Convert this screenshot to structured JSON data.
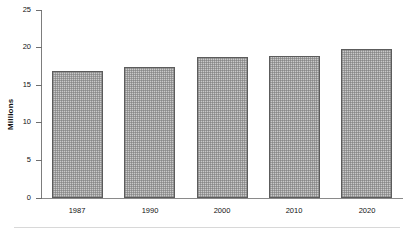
{
  "chart_data": {
    "type": "bar",
    "title": "",
    "subtitle": "",
    "xlabel": "",
    "ylabel": "Millions",
    "categories": [
      "1987",
      "1990",
      "2000",
      "2010",
      "2020"
    ],
    "values": [
      16.9,
      17.4,
      18.8,
      18.9,
      19.8
    ],
    "series": [
      {
        "name": "Millions",
        "values": [
          16.9,
          17.4,
          18.8,
          18.9,
          19.8
        ]
      }
    ],
    "ylim": [
      0,
      25
    ],
    "ytick_labels": [
      "0",
      "5",
      "10",
      "15",
      "20",
      "25"
    ],
    "ytick_values": [
      0,
      5,
      10,
      15,
      20,
      25
    ],
    "grid": false,
    "legend": false,
    "legend_position": "none",
    "bar_fill_color": "#c9c9c9",
    "bar_border_color": "#5c5c5c",
    "axis_color": "#7d7d7d",
    "text_color": "#111111",
    "background_color": "#ffffff",
    "annotations": []
  },
  "axis": {
    "y_title": "Millions",
    "ticks": [
      {
        "label": "25",
        "value": 25
      },
      {
        "label": "20",
        "value": 20
      },
      {
        "label": "15",
        "value": 15
      },
      {
        "label": "10",
        "value": 10
      },
      {
        "label": "5",
        "value": 5
      },
      {
        "label": "0",
        "value": 0
      }
    ]
  },
  "bars": [
    {
      "label": "1987",
      "value": 16.9
    },
    {
      "label": "1990",
      "value": 17.4
    },
    {
      "label": "2000",
      "value": 18.8
    },
    {
      "label": "2010",
      "value": 18.9
    },
    {
      "label": "2020",
      "value": 19.8
    }
  ]
}
